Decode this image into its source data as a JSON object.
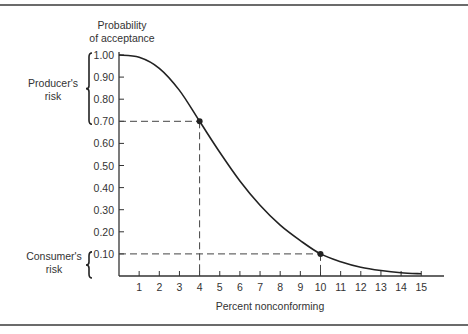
{
  "chart_data": {
    "type": "line",
    "title": "",
    "xlabel": "Percent nonconforming",
    "ylabel": "Probability of acceptance",
    "ylabel_lines": [
      "Probability",
      "of acceptance"
    ],
    "xlim": [
      0,
      15
    ],
    "ylim": [
      0,
      1.0
    ],
    "grid": false,
    "x_ticks": [
      1,
      2,
      3,
      4,
      5,
      6,
      7,
      8,
      9,
      10,
      11,
      12,
      13,
      14,
      15
    ],
    "y_ticks": [
      "1.00",
      "0.90",
      "0.80",
      "0.70",
      "0.60",
      "0.50",
      "0.40",
      "0.30",
      "0.20",
      "0.10"
    ],
    "y_tick_values": [
      1.0,
      0.9,
      0.8,
      0.7,
      0.6,
      0.5,
      0.4,
      0.3,
      0.2,
      0.1
    ],
    "series": [
      {
        "name": "Operating characteristic curve",
        "x": [
          0,
          1,
          2,
          3,
          4,
          5,
          6,
          7,
          8,
          9,
          10,
          11,
          12,
          13,
          14,
          15
        ],
        "values": [
          1.0,
          0.99,
          0.94,
          0.84,
          0.7,
          0.56,
          0.43,
          0.32,
          0.23,
          0.16,
          0.1,
          0.065,
          0.04,
          0.025,
          0.015,
          0.01
        ]
      }
    ],
    "marked_points": [
      {
        "x": 4,
        "y": 0.7
      },
      {
        "x": 10,
        "y": 0.1
      }
    ],
    "annotations": [
      {
        "text_lines": [
          "Producer's",
          "risk"
        ],
        "bracket_range": [
          0.7,
          1.0
        ]
      },
      {
        "text_lines": [
          "Consumer's",
          "risk"
        ],
        "bracket_range": [
          0.0,
          0.1
        ]
      }
    ],
    "reference_lines": [
      {
        "type": "dashed",
        "from": [
          0,
          0.7
        ],
        "to": [
          4,
          0.7
        ]
      },
      {
        "type": "dashed",
        "from": [
          4,
          0.7
        ],
        "to": [
          4,
          0
        ]
      },
      {
        "type": "dashed",
        "from": [
          0,
          0.1
        ],
        "to": [
          10,
          0.1
        ]
      },
      {
        "type": "dashed",
        "from": [
          10,
          0.1
        ],
        "to": [
          10,
          0
        ]
      }
    ]
  },
  "labels": {
    "ylabel_line1": "Probability",
    "ylabel_line2": "of acceptance",
    "xlabel": "Percent nonconforming",
    "producer_line1": "Producer's",
    "producer_line2": "risk",
    "consumer_line1": "Consumer's",
    "consumer_line2": "risk"
  },
  "colors": {
    "curve": "#222222",
    "axis": "#333333",
    "dash": "#444444",
    "frame": "#6b6b6b"
  }
}
